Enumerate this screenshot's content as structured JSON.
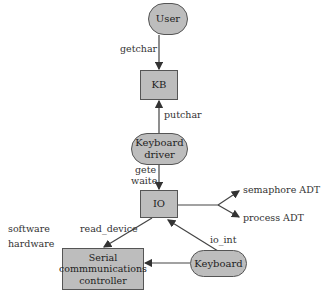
{
  "nodes": {
    "user": {
      "label": "User",
      "shape": "pill"
    },
    "kb": {
      "label": "KB",
      "shape": "box"
    },
    "keyboard_driver": {
      "label_line1": "Keyboard",
      "label_line2": "driver",
      "shape": "pill"
    },
    "io": {
      "label": "IO",
      "shape": "box"
    },
    "serial": {
      "label_line1": "Serial",
      "label_line2": "commmunications",
      "label_line3": "controller",
      "shape": "box"
    },
    "keyboard": {
      "label": "Keyboard",
      "shape": "pill"
    }
  },
  "edges": {
    "getchar": "getchar",
    "putchar": "putchar",
    "gete": "gete",
    "waite": "waite",
    "read_device": "read_device",
    "io_int": "io_int",
    "semaphore": "semaphore ADT",
    "process": "process ADT"
  },
  "layers": {
    "software": "software",
    "hardware": "hardware"
  },
  "colors": {
    "fill": "#bdbdbd",
    "stroke": "#555555"
  }
}
